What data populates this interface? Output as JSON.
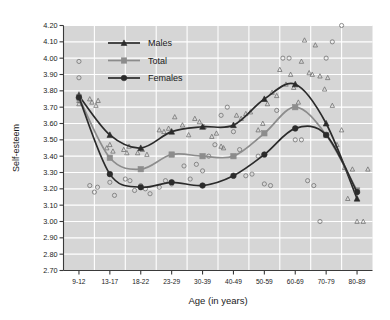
{
  "chart_data": {
    "type": "line",
    "title": "",
    "xlabel": "Age (in years)",
    "ylabel": "Self-esteem",
    "categories": [
      "9-12",
      "13-17",
      "18-22",
      "23-29",
      "30-39",
      "40-49",
      "50-59",
      "60-69",
      "70-79",
      "80-89"
    ],
    "ylim": [
      2.7,
      4.2
    ],
    "ytick_labels": [
      "2.70",
      "2.80",
      "2.90",
      "3.00",
      "3.10",
      "3.20",
      "3.30",
      "3.40",
      "3.50",
      "3.60",
      "3.70",
      "3.80",
      "3.90",
      "4.00",
      "4.10",
      "4.20"
    ],
    "ytick_values": [
      2.7,
      2.8,
      2.9,
      3.0,
      3.1,
      3.2,
      3.3,
      3.4,
      3.5,
      3.6,
      3.7,
      3.8,
      3.9,
      4.0,
      4.1,
      4.2
    ],
    "grid": true,
    "grid_color": "#ffffff",
    "plot_background": "#d6d6d6",
    "legend_position": "upper-left",
    "series": [
      {
        "name": "Males",
        "marker": "triangle",
        "color": "#2b2b2b",
        "values": [
          3.77,
          3.53,
          3.45,
          3.55,
          3.58,
          3.59,
          3.75,
          3.84,
          3.6,
          3.14
        ]
      },
      {
        "name": "Total",
        "marker": "square",
        "color": "#8c8c8c",
        "values": [
          3.76,
          3.39,
          3.32,
          3.41,
          3.4,
          3.4,
          3.54,
          3.7,
          3.53,
          3.19
        ]
      },
      {
        "name": "Females",
        "marker": "circle",
        "color": "#2b2b2b",
        "values": [
          3.76,
          3.29,
          3.21,
          3.24,
          3.22,
          3.28,
          3.41,
          3.57,
          3.53,
          3.18
        ]
      }
    ],
    "scatter_males": [
      [
        0,
        3.76
      ],
      [
        0,
        3.74
      ],
      [
        0,
        3.78
      ],
      [
        0,
        3.72
      ],
      [
        0.35,
        3.75
      ],
      [
        0.42,
        3.73
      ],
      [
        0.55,
        3.71
      ],
      [
        0.62,
        3.74
      ],
      [
        0.9,
        3.45
      ],
      [
        1.0,
        3.47
      ],
      [
        1.1,
        3.43
      ],
      [
        1.45,
        3.44
      ],
      [
        1.55,
        3.42
      ],
      [
        1.62,
        3.46
      ],
      [
        1.9,
        3.42
      ],
      [
        2.05,
        3.44
      ],
      [
        2.2,
        3.41
      ],
      [
        2.6,
        3.56
      ],
      [
        2.75,
        3.55
      ],
      [
        2.9,
        3.57
      ],
      [
        3.1,
        3.64
      ],
      [
        3.35,
        3.59
      ],
      [
        3.55,
        3.53
      ],
      [
        3.75,
        3.63
      ],
      [
        3.9,
        3.61
      ],
      [
        4.05,
        3.58
      ],
      [
        4.3,
        3.52
      ],
      [
        4.45,
        3.54
      ],
      [
        4.6,
        3.46
      ],
      [
        4.68,
        3.45
      ],
      [
        5.1,
        3.65
      ],
      [
        5.25,
        3.63
      ],
      [
        5.4,
        3.66
      ],
      [
        5.55,
        3.67
      ],
      [
        5.8,
        3.56
      ],
      [
        5.95,
        3.6
      ],
      [
        6.1,
        3.72
      ],
      [
        6.25,
        3.79
      ],
      [
        6.4,
        3.77
      ],
      [
        6.5,
        3.93
      ],
      [
        6.7,
        3.84
      ],
      [
        6.85,
        3.9
      ],
      [
        6.95,
        3.82
      ],
      [
        7.1,
        3.73
      ],
      [
        7.2,
        3.98
      ],
      [
        7.3,
        4.11
      ],
      [
        7.45,
        3.91
      ],
      [
        7.55,
        3.9
      ],
      [
        7.65,
        4.08
      ],
      [
        7.8,
        3.89
      ],
      [
        7.95,
        3.81
      ],
      [
        8.05,
        3.88
      ],
      [
        8.2,
        3.71
      ],
      [
        8.35,
        3.47
      ],
      [
        8.5,
        3.56
      ],
      [
        8.6,
        3.33
      ],
      [
        8.7,
        3.14
      ],
      [
        8.85,
        3.32
      ],
      [
        9.0,
        3.0
      ],
      [
        9.2,
        3.0
      ],
      [
        9.35,
        3.32
      ]
    ],
    "scatter_females": [
      [
        0,
        3.98
      ],
      [
        0,
        3.88
      ],
      [
        0,
        3.75
      ],
      [
        0.35,
        3.22
      ],
      [
        0.5,
        3.18
      ],
      [
        0.6,
        3.21
      ],
      [
        1.0,
        3.24
      ],
      [
        1.15,
        3.16
      ],
      [
        1.5,
        3.26
      ],
      [
        1.65,
        3.25
      ],
      [
        1.8,
        3.19
      ],
      [
        2.0,
        3.22
      ],
      [
        2.15,
        3.2
      ],
      [
        2.3,
        3.17
      ],
      [
        2.6,
        3.21
      ],
      [
        2.8,
        3.25
      ],
      [
        3.0,
        3.23
      ],
      [
        3.4,
        3.34
      ],
      [
        3.6,
        3.26
      ],
      [
        3.8,
        3.35
      ],
      [
        4.0,
        3.31
      ],
      [
        4.2,
        3.4
      ],
      [
        4.4,
        3.47
      ],
      [
        4.6,
        3.65
      ],
      [
        4.8,
        3.7
      ],
      [
        5.0,
        3.55
      ],
      [
        5.2,
        3.44
      ],
      [
        5.4,
        3.28
      ],
      [
        5.6,
        3.29
      ],
      [
        5.8,
        3.4
      ],
      [
        6.0,
        3.23
      ],
      [
        6.2,
        3.22
      ],
      [
        6.4,
        3.68
      ],
      [
        6.6,
        4.0
      ],
      [
        6.8,
        4.0
      ],
      [
        7.0,
        3.5
      ],
      [
        7.2,
        3.5
      ],
      [
        7.4,
        3.25
      ],
      [
        7.6,
        3.22
      ],
      [
        7.8,
        3.0
      ],
      [
        8.0,
        4.0
      ],
      [
        8.2,
        4.1
      ],
      [
        8.5,
        4.2
      ]
    ]
  },
  "legend": {
    "items": [
      {
        "label": "Males"
      },
      {
        "label": "Total"
      },
      {
        "label": "Females"
      }
    ]
  }
}
